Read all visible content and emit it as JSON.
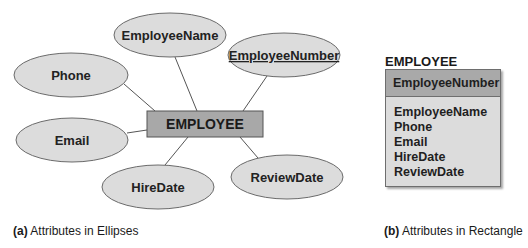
{
  "figure_a": {
    "entity": {
      "label": "EMPLOYEE",
      "fill": "#a8a8a8",
      "stroke": "#555555"
    },
    "attributes": [
      {
        "label": "EmployeeName",
        "key": false
      },
      {
        "label": "EmployeeNumber",
        "key": true
      },
      {
        "label": "Phone",
        "key": false
      },
      {
        "label": "Email",
        "key": false
      },
      {
        "label": "HireDate",
        "key": false
      },
      {
        "label": "ReviewDate",
        "key": false
      }
    ],
    "ellipse_fill": "#dcdcdc",
    "caption_prefix": "(a)",
    "caption_text": " Attributes in Ellipses"
  },
  "figure_b": {
    "entity_title": "EMPLOYEE",
    "key_attribute": "EmployeeNumber",
    "attributes": [
      "EmployeeName",
      "Phone",
      "Email",
      "HireDate",
      "ReviewDate"
    ],
    "caption_prefix": "(b)",
    "caption_text": " Attributes in Rectangle"
  }
}
